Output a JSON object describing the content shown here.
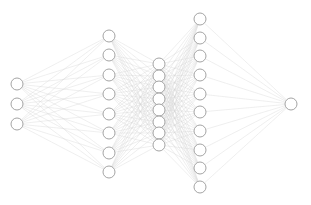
{
  "figure": {
    "background_color": "#ffffff",
    "width": 311,
    "height": 205
  },
  "style": {
    "node_fill": "#ffffff",
    "node_stroke": "#9a9a9a",
    "node_stroke_width": 0.9,
    "node_radius": 6,
    "edge_color": "#d4d4d4",
    "edge_width": 0.45,
    "edge_opacity": 0.85
  },
  "chart_data": {
    "type": "diagram",
    "diagram_kind": "neural-network",
    "title": "",
    "xlabel": "",
    "ylabel": "",
    "layer_sizes": [
      3,
      8,
      8,
      10,
      1
    ],
    "total_nodes": 30,
    "total_edges": 202,
    "fully_connected": true,
    "layers": [
      {
        "name": "input-layer",
        "index": 0,
        "node_count": 3,
        "x": 17,
        "nodes": [
          {
            "id": "n0-0",
            "cx": 17,
            "cy": 84
          },
          {
            "id": "n0-1",
            "cx": 17,
            "cy": 104
          },
          {
            "id": "n0-2",
            "cx": 17,
            "cy": 124
          }
        ]
      },
      {
        "name": "hidden-layer-1",
        "index": 1,
        "node_count": 8,
        "x": 109,
        "nodes": [
          {
            "id": "n1-0",
            "cx": 109,
            "cy": 36
          },
          {
            "id": "n1-1",
            "cx": 109,
            "cy": 55
          },
          {
            "id": "n1-2",
            "cx": 109,
            "cy": 75
          },
          {
            "id": "n1-3",
            "cx": 109,
            "cy": 94
          },
          {
            "id": "n1-4",
            "cx": 109,
            "cy": 114
          },
          {
            "id": "n1-5",
            "cx": 109,
            "cy": 133
          },
          {
            "id": "n1-6",
            "cx": 109,
            "cy": 153
          },
          {
            "id": "n1-7",
            "cx": 109,
            "cy": 172
          }
        ]
      },
      {
        "name": "hidden-layer-2",
        "index": 2,
        "node_count": 8,
        "x": 159,
        "nodes": [
          {
            "id": "n2-0",
            "cx": 159,
            "cy": 64
          },
          {
            "id": "n2-1",
            "cx": 159,
            "cy": 76
          },
          {
            "id": "n2-2",
            "cx": 159,
            "cy": 87
          },
          {
            "id": "n2-3",
            "cx": 159,
            "cy": 99
          },
          {
            "id": "n2-4",
            "cx": 159,
            "cy": 110
          },
          {
            "id": "n2-5",
            "cx": 159,
            "cy": 122
          },
          {
            "id": "n2-6",
            "cx": 159,
            "cy": 133
          },
          {
            "id": "n2-7",
            "cx": 159,
            "cy": 145
          }
        ]
      },
      {
        "name": "hidden-layer-3",
        "index": 3,
        "node_count": 10,
        "x": 200,
        "nodes": [
          {
            "id": "n3-0",
            "cx": 200,
            "cy": 19
          },
          {
            "id": "n3-1",
            "cx": 200,
            "cy": 38
          },
          {
            "id": "n3-2",
            "cx": 200,
            "cy": 56
          },
          {
            "id": "n3-3",
            "cx": 200,
            "cy": 75
          },
          {
            "id": "n3-4",
            "cx": 200,
            "cy": 94
          },
          {
            "id": "n3-5",
            "cx": 200,
            "cy": 112
          },
          {
            "id": "n3-6",
            "cx": 200,
            "cy": 131
          },
          {
            "id": "n3-7",
            "cx": 200,
            "cy": 150
          },
          {
            "id": "n3-8",
            "cx": 200,
            "cy": 168
          },
          {
            "id": "n3-9",
            "cx": 200,
            "cy": 187
          }
        ]
      },
      {
        "name": "output-layer",
        "index": 4,
        "node_count": 1,
        "x": 291,
        "nodes": [
          {
            "id": "n4-0",
            "cx": 291,
            "cy": 104
          }
        ]
      }
    ]
  }
}
